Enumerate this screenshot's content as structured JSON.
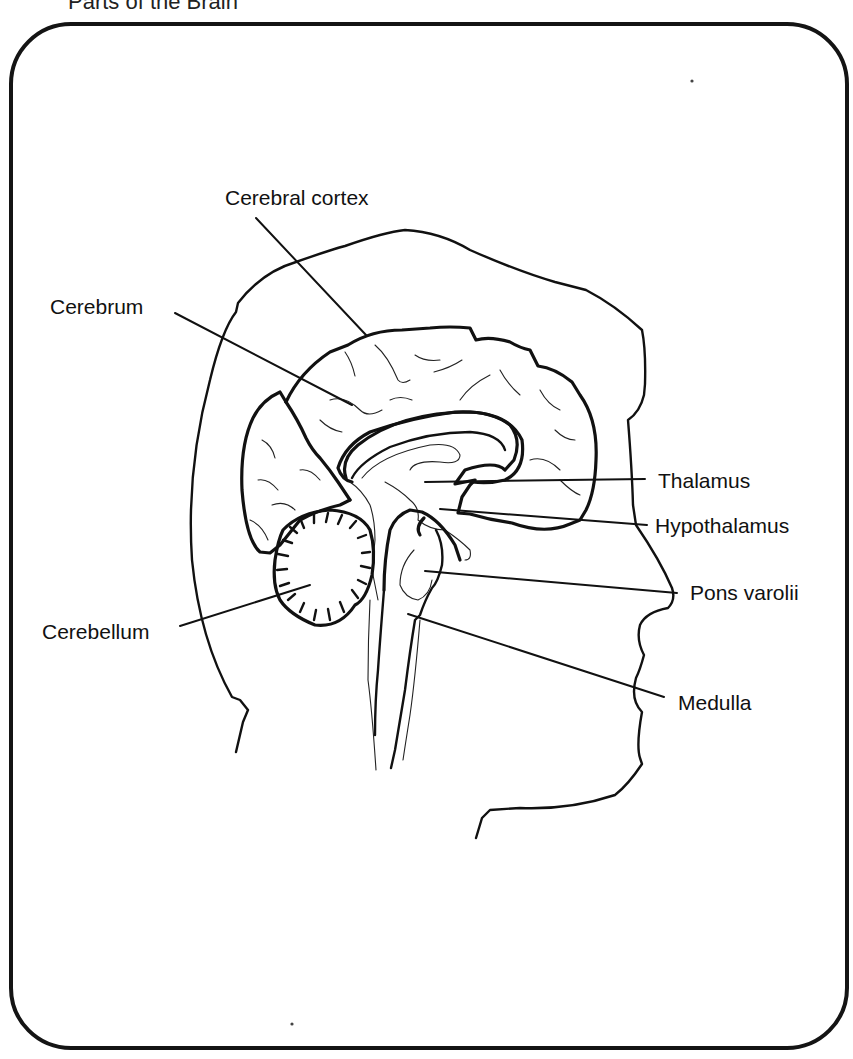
{
  "title": "Parts of the Brain",
  "labels": {
    "cerebral_cortex": "Cerebral cortex",
    "cerebrum": "Cerebrum",
    "thalamus": "Thalamus",
    "hypothalamus": "Hypothalamus",
    "pons_varolii": "Pons varolii",
    "cerebellum": "Cerebellum",
    "medulla": "Medulla"
  },
  "colors": {
    "ink": "#111111",
    "background": "#ffffff"
  }
}
